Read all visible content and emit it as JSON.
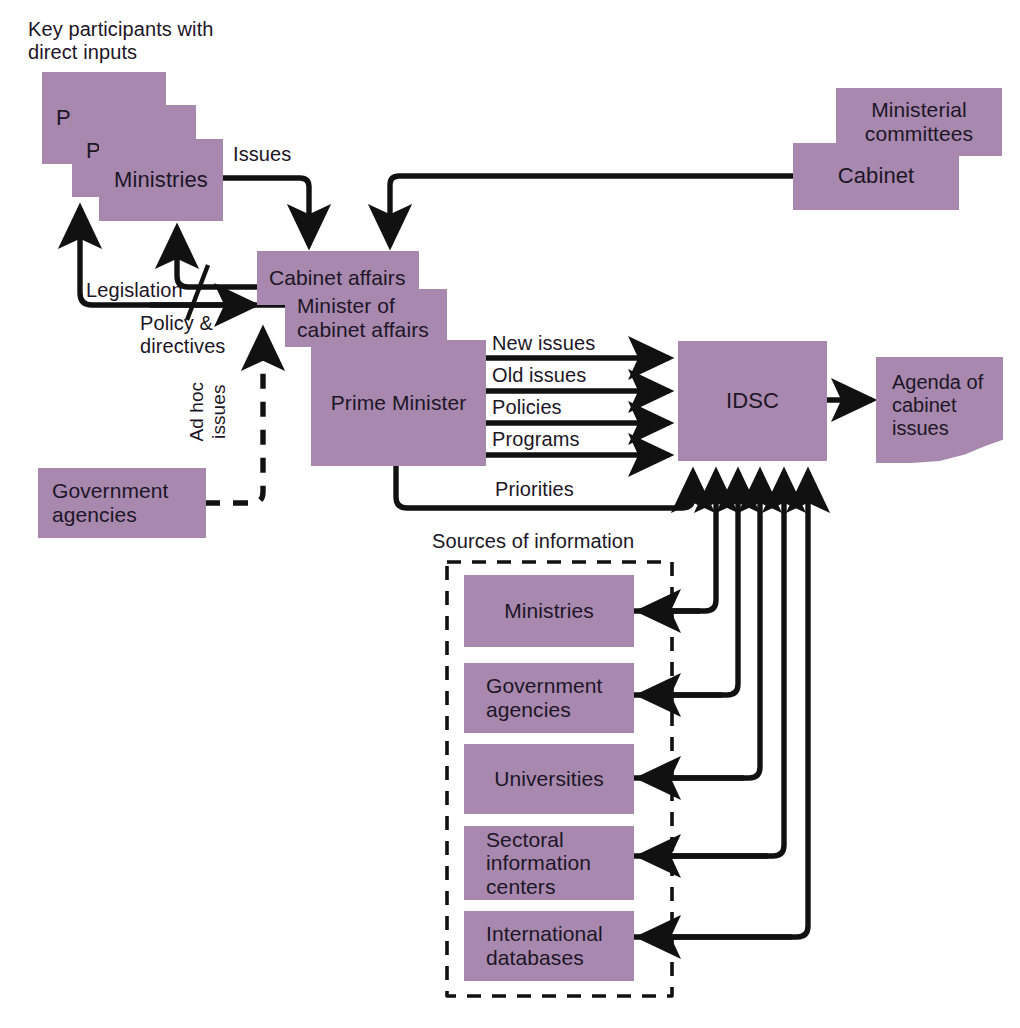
{
  "diagram": {
    "title_note": "Key participants with\ndirect inputs",
    "sources_caption": "Sources of information",
    "colors": {
      "box_fill": "#a888ae",
      "line": "#111111",
      "text": "#1c1626",
      "background": "#ffffff"
    },
    "nodes": {
      "president": "President",
      "parliament": "Parliament",
      "ministries_top": "Ministries",
      "ministerial_committees": "Ministerial\ncommittees",
      "cabinet": "Cabinet",
      "cabinet_affairs": "Cabinet affairs",
      "minister_of_cabinet_affairs": "Minister of\ncabinet affairs",
      "prime_minister": "Prime Minister",
      "government_agencies": "Government\nagencies",
      "idsc": "IDSC",
      "agenda": "Agenda of\ncabinet\nissues"
    },
    "sources": [
      {
        "id": "ministries",
        "label": "Ministries"
      },
      {
        "id": "government-agencies",
        "label": "Government\nagencies"
      },
      {
        "id": "universities",
        "label": "Universities"
      },
      {
        "id": "sectoral-information-centers",
        "label": "Sectoral\ninformation\ncenters"
      },
      {
        "id": "international-databases",
        "label": "International\ndatabases"
      }
    ],
    "edge_labels": {
      "issues": "Issues",
      "legislation": "Legislation",
      "policy_directives": "Policy &\ndirectives",
      "ad_hoc_issues": "Ad hoc\nissues",
      "new_issues": "New issues",
      "old_issues": "Old issues",
      "policies": "Policies",
      "programs": "Programs",
      "priorities": "Priorities"
    }
  }
}
